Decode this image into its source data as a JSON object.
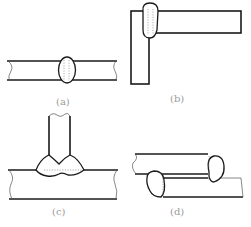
{
  "diagram": {
    "type": "weld-joint-types",
    "panels": [
      {
        "id": "a",
        "label": "(a)",
        "description": "butt weld between two plates"
      },
      {
        "id": "b",
        "label": "(b)",
        "description": "corner weld"
      },
      {
        "id": "c",
        "label": "(c)",
        "description": "T-joint double fillet weld"
      },
      {
        "id": "d",
        "label": "(d)",
        "description": "lap joint with fillet welds"
      }
    ],
    "colors": {
      "line": "#1a1a1a",
      "label": "#9a9a9a",
      "background": "#ffffff"
    }
  }
}
